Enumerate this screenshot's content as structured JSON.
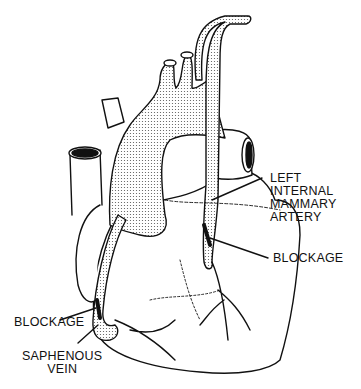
{
  "diagram": {
    "labels": {
      "lima": [
        "LEFT",
        "INTERNAL",
        "MAMMARY",
        "ARTERY"
      ],
      "blockage_right": "BLOCKAGE",
      "blockage_left": "BLOCKAGE",
      "saphenous": [
        "SAPHENOUS",
        "VEIN"
      ]
    },
    "colors": {
      "line": "#111111",
      "stipple": "#777777",
      "background": "#ffffff"
    }
  }
}
